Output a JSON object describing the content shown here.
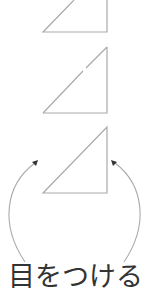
{
  "diagram": {
    "caption": "目をつける",
    "colors": {
      "line": "#aaaaaa",
      "arrowhead": "#333333",
      "text": "#333333",
      "background": "#ffffff"
    },
    "shapes": [
      {
        "type": "right-triangle",
        "label": "triangle-1",
        "right_angle": "bottom-right",
        "clipped_top": true
      },
      {
        "type": "right-triangle",
        "label": "triangle-2",
        "right_angle": "bottom-right"
      },
      {
        "type": "right-triangle",
        "label": "triangle-3",
        "right_angle": "bottom-right"
      }
    ],
    "arrows": [
      {
        "label": "left-curved-arrow",
        "direction": "up"
      },
      {
        "label": "right-curved-arrow",
        "direction": "up"
      }
    ]
  }
}
